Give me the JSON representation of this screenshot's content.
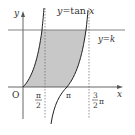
{
  "diagram": {
    "title_label": "y=tan x",
    "line_label": "y=k",
    "axes": {
      "x_label": "x",
      "y_label": "y",
      "origin_label": "O"
    },
    "ticks": {
      "half_pi_num": "π",
      "half_pi_den": "2",
      "pi": "π",
      "three_half_pi_num": "3",
      "three_half_pi_den": "2",
      "three_half_pi_suffix": "π"
    },
    "colors": {
      "shade": "#c8c8c8",
      "curve": "#222222",
      "axis": "#555555",
      "kline": "#777777",
      "asymptote": "#666666"
    }
  }
}
